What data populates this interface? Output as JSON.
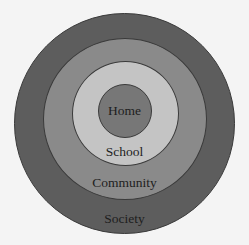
{
  "diagram": {
    "type": "concentric-circles",
    "layers": [
      {
        "label": "Society",
        "color": "#5d5d5d"
      },
      {
        "label": "Community",
        "color": "#8a8a8a"
      },
      {
        "label": "School",
        "color": "#c2c2c2"
      },
      {
        "label": "Home",
        "color": "#767676"
      }
    ]
  }
}
